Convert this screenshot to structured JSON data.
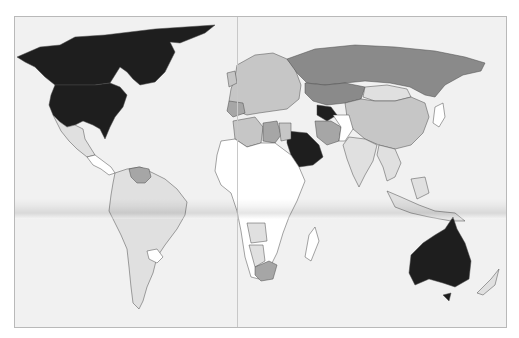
{
  "map": {
    "title": "",
    "type": "choropleth world map",
    "colors": {
      "ocean": "#f1f1f1",
      "frame_border": "#b9b9b9",
      "border_line": "#4a4a4a",
      "level_0": "#ffffff",
      "level_1": "#e0e0e0",
      "level_2": "#c6c6c6",
      "level_3": "#a6a6a6",
      "level_4": "#8a8a8a",
      "level_5": "#1e1e1e"
    },
    "shading": {
      "darkest": [
        "United States",
        "Canada",
        "Greenland",
        "Australia",
        "Saudi Arabia",
        "Turkmenistan"
      ],
      "dark_gray": [
        "Russia",
        "Kazakhstan",
        "Venezuela",
        "Iran",
        "Libya",
        "South Africa"
      ],
      "medium_gray": [
        "China",
        "Spain",
        "Egypt",
        "Algeria",
        "Angola",
        "Namibia",
        "Europe (most)"
      ],
      "light_gray": [
        "Mexico",
        "Brazil",
        "Argentina",
        "Peru",
        "Chile",
        "India",
        "Mongolia",
        "Indonesia"
      ],
      "white": [
        "Sub-Saharan Africa",
        "Paraguay",
        "Afghanistan",
        "Pakistan",
        "Madagascar",
        "Japan"
      ]
    },
    "legend": []
  }
}
